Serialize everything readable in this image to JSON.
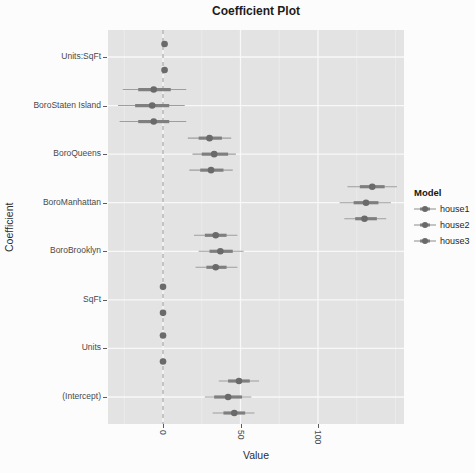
{
  "title": "Coefficient Plot",
  "axis": {
    "x": "Value",
    "y": "Coefficient"
  },
  "legend": {
    "title": "Model",
    "entries": [
      "house1",
      "house2",
      "house3"
    ]
  },
  "chart_data": {
    "type": "scatter",
    "subtype": "coefficient-dot-whisker-plot",
    "title": "Coefficient Plot",
    "xlabel": "Value",
    "ylabel": "Coefficient",
    "xlim": [
      -35.5,
      155.5
    ],
    "x_ticks": [
      0,
      50,
      100
    ],
    "x_minor_gridlines": [
      -25,
      25,
      75,
      125,
      150
    ],
    "grid": "on",
    "zero_line": {
      "x": 0,
      "style": "dashed"
    },
    "legend": {
      "title": "Model",
      "position": "right",
      "entries": [
        "house1",
        "house2",
        "house3"
      ]
    },
    "categories": [
      "Units:SqFt",
      "BoroStaten Island",
      "BoroQueens",
      "BoroManhattan",
      "BoroBrooklyn",
      "SqFt",
      "Units",
      "(Intercept)"
    ],
    "estimates_by_category": {
      "Units:SqFt": [
        {
          "model": "house2",
          "value": 1,
          "inner": [
            0,
            2
          ],
          "outer": [
            -1,
            3
          ]
        },
        {
          "model": "house3",
          "value": 1,
          "inner": [
            0,
            2
          ],
          "outer": [
            -1,
            3
          ]
        }
      ],
      "BoroStaten Island": [
        {
          "model": "house1",
          "value": -6,
          "inner": [
            -16,
            5
          ],
          "outer": [
            -26,
            15
          ]
        },
        {
          "model": "house2",
          "value": -7,
          "inner": [
            -18,
            4
          ],
          "outer": [
            -29,
            14
          ]
        },
        {
          "model": "house3",
          "value": -6,
          "inner": [
            -16,
            4
          ],
          "outer": [
            -28,
            15
          ]
        }
      ],
      "BoroQueens": [
        {
          "model": "house1",
          "value": 30,
          "inner": [
            23,
            38
          ],
          "outer": [
            16,
            44
          ]
        },
        {
          "model": "house2",
          "value": 33,
          "inner": [
            25,
            42
          ],
          "outer": [
            19,
            47
          ]
        },
        {
          "model": "house3",
          "value": 31,
          "inner": [
            24,
            39
          ],
          "outer": [
            17,
            45
          ]
        }
      ],
      "BoroManhattan": [
        {
          "model": "house1",
          "value": 135,
          "inner": [
            127,
            143
          ],
          "outer": [
            119,
            151
          ]
        },
        {
          "model": "house2",
          "value": 131,
          "inner": [
            123,
            139
          ],
          "outer": [
            114,
            147
          ]
        },
        {
          "model": "house3",
          "value": 130,
          "inner": [
            124,
            138
          ],
          "outer": [
            117,
            144
          ]
        }
      ],
      "BoroBrooklyn": [
        {
          "model": "house1",
          "value": 34,
          "inner": [
            27,
            41
          ],
          "outer": [
            20,
            48
          ]
        },
        {
          "model": "house2",
          "value": 37,
          "inner": [
            30,
            45
          ],
          "outer": [
            23,
            52
          ]
        },
        {
          "model": "house3",
          "value": 34,
          "inner": [
            28,
            41
          ],
          "outer": [
            21,
            48
          ]
        }
      ],
      "SqFt": [
        {
          "model": "house1",
          "value": 0,
          "inner": [
            0,
            0
          ],
          "outer": [
            -1,
            1
          ]
        },
        {
          "model": "house2",
          "value": 0,
          "inner": [
            0,
            0
          ],
          "outer": [
            -1,
            1
          ]
        }
      ],
      "Units": [
        {
          "model": "house1",
          "value": 0,
          "inner": [
            -1,
            1
          ],
          "outer": [
            -2,
            2
          ]
        },
        {
          "model": "house2",
          "value": 0,
          "inner": [
            -1,
            1
          ],
          "outer": [
            -2,
            2
          ]
        }
      ],
      "(Intercept)": [
        {
          "model": "house1",
          "value": 49,
          "inner": [
            42,
            56
          ],
          "outer": [
            36,
            62
          ]
        },
        {
          "model": "house2",
          "value": 42,
          "inner": [
            33,
            51
          ],
          "outer": [
            27,
            57
          ]
        },
        {
          "model": "house3",
          "value": 46,
          "inner": [
            39,
            53
          ],
          "outer": [
            32,
            59
          ]
        }
      ]
    },
    "style": {
      "panel_bg": "#e3e3e3",
      "grid_major": "#f8f8f8",
      "grid_minor": "#eeeeee",
      "zero_line": "#b5b5b5",
      "point": "#6a6a6a",
      "inner_bar": "#7f7f7f",
      "outer_bar": "#9e9e9e",
      "text": "#4a4a4a"
    }
  }
}
